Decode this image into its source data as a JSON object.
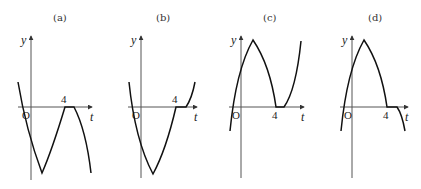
{
  "figure": {
    "panels": [
      {
        "label": "(a)",
        "y_axis_label": "y",
        "t_axis_label": "t",
        "origin_label": "O",
        "tick_label": "4"
      },
      {
        "label": "(b)",
        "y_axis_label": "y",
        "t_axis_label": "t",
        "origin_label": "O",
        "tick_label": "4"
      },
      {
        "label": "(c)",
        "y_axis_label": "y",
        "t_axis_label": "t",
        "origin_label": "O",
        "tick_label": "4"
      },
      {
        "label": "(d)",
        "y_axis_label": "y",
        "t_axis_label": "t",
        "origin_label": "O",
        "tick_label": "4"
      }
    ],
    "colors": {
      "curve": "#111111",
      "axis": "#555555"
    }
  }
}
